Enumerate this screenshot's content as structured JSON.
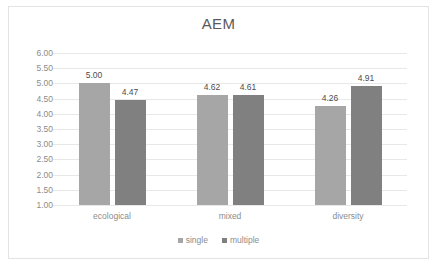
{
  "chart_data": {
    "type": "bar",
    "title": "AEM",
    "xlabel": "",
    "ylabel": "",
    "categories": [
      "ecological",
      "mixed",
      "diversity"
    ],
    "series": [
      {
        "name": "single",
        "color": "#a6a6a6",
        "values": [
          5.0,
          4.62,
          4.26
        ],
        "labels": [
          "5.00",
          "4.62",
          "4.26"
        ]
      },
      {
        "name": "multiple",
        "color": "#808080",
        "values": [
          4.47,
          4.61,
          4.91
        ],
        "labels": [
          "4.47",
          "4.61",
          "4.91"
        ]
      }
    ],
    "ylim": [
      1.0,
      6.0
    ],
    "ytick_step": 0.5,
    "yticks": [
      "6.00",
      "5.50",
      "5.00",
      "4.50",
      "4.00",
      "3.50",
      "3.00",
      "2.50",
      "2.00",
      "1.50",
      "1.00"
    ],
    "grid": true,
    "legend_position": "bottom-center",
    "border_color": "#e3e3e3",
    "gridline_color": "#e8e8e8"
  }
}
